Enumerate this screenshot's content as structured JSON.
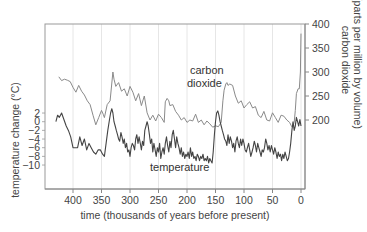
{
  "chart_data": {
    "type": "line",
    "title": "",
    "xlabel": "time (thousands of years before present)",
    "ylabel_left": "temperature change (°C)",
    "ylabel_right_line1": "carbon dioxide",
    "ylabel_right_line2": "(parts per million by volume)",
    "x_ticks": [
      "400",
      "350",
      "300",
      "250",
      "200",
      "150",
      "100",
      "50",
      "0"
    ],
    "x_tick_values": [
      400,
      350,
      300,
      250,
      200,
      150,
      100,
      50,
      0
    ],
    "xlim": [
      445,
      -4
    ],
    "y_left_ticks": [
      "2",
      "0",
      "−2",
      "−4",
      "−6",
      "−8",
      "−10"
    ],
    "y_left_tick_values": [
      2,
      0,
      -2,
      -4,
      -6,
      -8,
      -10
    ],
    "y_right_ticks": [
      "400",
      "350",
      "300",
      "250",
      "200"
    ],
    "y_right_tick_values": [
      400,
      350,
      300,
      250,
      200
    ],
    "grid": "vertical gridlines at x ticks",
    "legend": "inline labels",
    "annotations": [
      "carbon dioxide",
      "temperature"
    ],
    "series": [
      {
        "name": "carbon dioxide",
        "axis": "right",
        "unit": "ppmv",
        "color": "#8a8a8a",
        "x": [
          425,
          420,
          415,
          410,
          405,
          400,
          395,
          390,
          385,
          380,
          375,
          370,
          365,
          360,
          355,
          350,
          347,
          345,
          340,
          335,
          330,
          328,
          325,
          322,
          320,
          315,
          310,
          305,
          300,
          295,
          290,
          285,
          280,
          275,
          270,
          265,
          260,
          255,
          250,
          245,
          240,
          238,
          235,
          232,
          230,
          225,
          220,
          215,
          210,
          205,
          200,
          195,
          190,
          185,
          180,
          175,
          170,
          165,
          160,
          155,
          150,
          145,
          140,
          137,
          135,
          132,
          130,
          128,
          125,
          120,
          115,
          110,
          105,
          100,
          95,
          90,
          85,
          80,
          75,
          70,
          65,
          60,
          55,
          50,
          45,
          40,
          35,
          30,
          25,
          20,
          17,
          15,
          12,
          10,
          8,
          5,
          3,
          1,
          0
        ],
        "values": [
          290,
          282,
          285,
          283,
          280,
          268,
          258,
          272,
          260,
          252,
          240,
          232,
          210,
          190,
          205,
          220,
          212,
          205,
          232,
          240,
          300,
          285,
          270,
          275,
          278,
          260,
          265,
          250,
          270,
          258,
          240,
          255,
          230,
          250,
          215,
          200,
          210,
          198,
          212,
          205,
          195,
          238,
          245,
          240,
          230,
          232,
          218,
          210,
          200,
          205,
          195,
          200,
          198,
          212,
          195,
          200,
          190,
          198,
          192,
          185,
          188,
          186,
          195,
          240,
          262,
          275,
          278,
          272,
          275,
          272,
          250,
          235,
          240,
          225,
          232,
          238,
          225,
          228,
          210,
          205,
          218,
          200,
          198,
          215,
          205,
          195,
          210,
          208,
          200,
          195,
          188,
          185,
          195,
          220,
          255,
          265,
          265,
          300,
          380
        ]
      },
      {
        "name": "temperature",
        "axis": "left",
        "unit": "°C",
        "color": "#444444",
        "x": [
          430,
          427,
          424,
          420,
          416,
          412,
          408,
          404,
          400,
          396,
          392,
          388,
          384,
          380,
          376,
          372,
          368,
          364,
          360,
          356,
          352,
          348,
          345,
          342,
          339,
          336,
          334,
          332,
          330,
          328,
          326,
          324,
          322,
          320,
          318,
          316,
          314,
          312,
          310,
          308,
          306,
          304,
          302,
          300,
          298,
          296,
          294,
          292,
          290,
          288,
          286,
          284,
          282,
          280,
          278,
          276,
          274,
          272,
          270,
          268,
          266,
          264,
          262,
          260,
          258,
          256,
          254,
          252,
          250,
          248,
          246,
          244,
          242,
          240,
          238,
          236,
          234,
          232,
          230,
          228,
          226,
          224,
          222,
          220,
          218,
          216,
          214,
          212,
          210,
          208,
          206,
          204,
          202,
          200,
          198,
          196,
          194,
          192,
          190,
          188,
          186,
          184,
          182,
          180,
          178,
          176,
          174,
          172,
          170,
          168,
          166,
          164,
          162,
          160,
          158,
          156,
          154,
          152,
          150,
          148,
          146,
          144,
          142,
          140,
          138,
          136,
          134,
          132,
          130,
          128,
          126,
          124,
          122,
          120,
          118,
          116,
          114,
          112,
          110,
          108,
          106,
          104,
          102,
          100,
          98,
          96,
          94,
          92,
          90,
          88,
          86,
          84,
          82,
          80,
          78,
          76,
          74,
          72,
          70,
          68,
          66,
          64,
          62,
          60,
          58,
          56,
          54,
          52,
          50,
          48,
          46,
          44,
          42,
          40,
          38,
          36,
          34,
          32,
          30,
          28,
          26,
          24,
          22,
          20,
          18,
          16,
          14,
          12,
          10,
          8,
          6,
          4,
          2,
          0
        ],
        "values": [
          0,
          1.5,
          1,
          2,
          0.5,
          -1,
          -2,
          -3.5,
          -6,
          -6,
          -6,
          -3.5,
          -5.5,
          -4,
          -6.5,
          -5,
          -6,
          -7,
          -7.5,
          -6.5,
          -6.5,
          -7.5,
          -8,
          -5,
          -2,
          0.5,
          2,
          3,
          2,
          0,
          -1,
          -2,
          -3,
          -4,
          -4.5,
          -2.5,
          -3.5,
          -5,
          -4,
          -6,
          -5,
          -7,
          -6.5,
          -8,
          -6,
          -5,
          -5.5,
          -6.5,
          -4,
          -3,
          -5,
          -3.5,
          -5,
          -6.5,
          -4.5,
          -5.5,
          -2,
          -1,
          0,
          -1,
          -3,
          -5,
          -4,
          -7,
          -5,
          -6.5,
          -8,
          -6,
          -7,
          -5,
          -8.5,
          -7,
          -6,
          -7.5,
          -5,
          -3.5,
          -5.5,
          -7,
          -4.5,
          -6,
          -3,
          -2,
          -4,
          -6,
          -3.5,
          -5,
          -6,
          -7.5,
          -6,
          -8,
          -7,
          -8.5,
          -7.5,
          -8,
          -7,
          -8.5,
          -6,
          -8,
          -7,
          -8.5,
          -8,
          -9,
          -7.5,
          -8,
          -9,
          -8,
          -8.5,
          -7.5,
          -9,
          -8.5,
          -9,
          -8,
          -9.5,
          -8.5,
          -9,
          -9.5,
          -7,
          -3,
          0,
          2,
          2.5,
          1.5,
          0,
          -1,
          -2,
          -3,
          -4,
          -4.5,
          -5.5,
          -3,
          -5,
          -3.5,
          -4.5,
          -6,
          -5,
          -7,
          -4.5,
          -3.5,
          -5,
          -6,
          -4,
          -5.5,
          -4,
          -5,
          -6.5,
          -7,
          -6,
          -5,
          -6.5,
          -8,
          -7,
          -6,
          -4.5,
          -5.5,
          -7,
          -5,
          -6,
          -7,
          -8,
          -6.5,
          -7,
          -6,
          -4,
          -5,
          -6.5,
          -5.5,
          -7,
          -5.5,
          -6.5,
          -7.5,
          -6,
          -7,
          -8.5,
          -7,
          -8,
          -7.5,
          -9,
          -7.5,
          -8.5,
          -7,
          -8,
          -9,
          -8.5,
          -7,
          -5,
          -2,
          0,
          -2,
          -1,
          1,
          0,
          -1,
          0.5,
          -1
        ]
      }
    ]
  }
}
